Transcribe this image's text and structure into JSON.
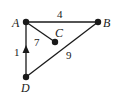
{
  "diagram": {
    "type": "weighted-graph",
    "nodes": [
      {
        "id": "A",
        "label": "A",
        "x": 26,
        "y": 22
      },
      {
        "id": "B",
        "label": "B",
        "x": 98,
        "y": 22
      },
      {
        "id": "C",
        "label": "C",
        "x": 55,
        "y": 42
      },
      {
        "id": "D",
        "label": "D",
        "x": 26,
        "y": 77
      }
    ],
    "edges": [
      {
        "from": "A",
        "to": "B",
        "weight": "4",
        "directed": false
      },
      {
        "from": "A",
        "to": "C",
        "weight": "7",
        "directed": false
      },
      {
        "from": "D",
        "to": "A",
        "weight": "1",
        "directed": true
      },
      {
        "from": "B",
        "to": "D",
        "weight": "9",
        "directed": false
      }
    ],
    "colors": {
      "ink": "#1a1a1a",
      "background": "#ffffff"
    }
  }
}
